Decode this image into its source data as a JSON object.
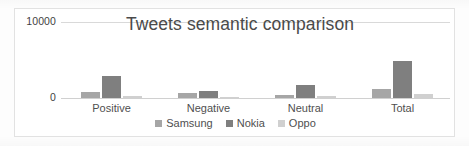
{
  "chart_data": {
    "type": "bar",
    "title": "Tweets semantic comparison",
    "xlabel": "",
    "ylabel": "",
    "categories": [
      "Positive",
      "Negative",
      "Neutral",
      "Total"
    ],
    "series": [
      {
        "name": "Samsung",
        "color": "#a6a6a6",
        "values": [
          800,
          650,
          400,
          1200
        ]
      },
      {
        "name": "Nokia",
        "color": "#7f7f7f",
        "values": [
          2900,
          950,
          1700,
          4900
        ]
      },
      {
        "name": "Oppo",
        "color": "#d0d0d0",
        "values": [
          250,
          100,
          200,
          500
        ]
      }
    ],
    "ylim": [
      0,
      10000
    ],
    "ytick_labels": [
      "10000",
      "0"
    ],
    "ytick_values": [
      10000,
      0
    ],
    "grid": true,
    "legend_position": "bottom"
  },
  "legend": {
    "items": [
      {
        "label": "Samsung"
      },
      {
        "label": "Nokia"
      },
      {
        "label": "Oppo"
      }
    ]
  },
  "axis": {
    "top_label": "10000",
    "zero_label": "0"
  }
}
